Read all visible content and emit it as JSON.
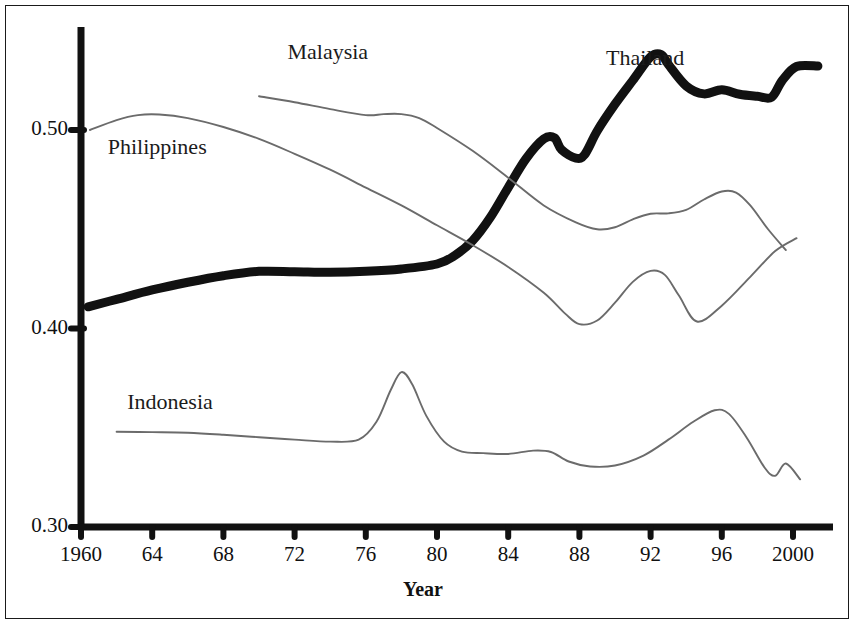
{
  "chart_data": {
    "type": "line",
    "title": "",
    "subtitle": "",
    "xlabel": "Year",
    "ylabel": "",
    "xlim": [
      1960,
      2002
    ],
    "ylim": [
      0.3,
      0.55
    ],
    "grid": false,
    "legend_position": "inline-labels",
    "x_tick_labels": [
      "1960",
      "64",
      "68",
      "72",
      "76",
      "80",
      "84",
      "88",
      "92",
      "96",
      "2000"
    ],
    "x_ticks": [
      1960,
      1964,
      1968,
      1972,
      1976,
      1980,
      1984,
      1988,
      1992,
      1996,
      2000
    ],
    "y_tick_labels": [
      "0.30",
      "0.40",
      "0.50"
    ],
    "y_ticks": [
      0.3,
      0.4,
      0.5
    ],
    "series": [
      {
        "name": "Thailand",
        "style": "thick-black",
        "color": "#111111",
        "label_x": 1989.5,
        "label_y": 0.5355,
        "x": [
          1960.4,
          1962,
          1964,
          1966,
          1968,
          1970,
          1972,
          1974,
          1976,
          1978,
          1980,
          1981,
          1982,
          1983,
          1984,
          1985,
          1986,
          1986.6,
          1987,
          1987.8,
          1988.3,
          1989,
          1990,
          1991,
          1992,
          1992.6,
          1993,
          1994,
          1995,
          1996,
          1997,
          1998,
          1998.8,
          1999.4,
          2000.2,
          2001.4
        ],
        "y": [
          0.4109,
          0.4147,
          0.4194,
          0.4233,
          0.4266,
          0.4288,
          0.4286,
          0.4283,
          0.4288,
          0.43,
          0.4325,
          0.4368,
          0.4442,
          0.456,
          0.471,
          0.4855,
          0.4955,
          0.496,
          0.49,
          0.4858,
          0.4877,
          0.4995,
          0.513,
          0.525,
          0.5368,
          0.538,
          0.533,
          0.5222,
          0.5182,
          0.5203,
          0.518,
          0.517,
          0.5165,
          0.525,
          0.532,
          0.5322
        ]
      },
      {
        "name": "Malaysia",
        "style": "thin-gray",
        "color": "#6b6b6b",
        "label_x": 1971.6,
        "label_y": 0.5385,
        "x": [
          1970,
          1972,
          1974,
          1976,
          1977,
          1978,
          1979,
          1980,
          1982,
          1984,
          1986,
          1987.8,
          1989,
          1990,
          1991,
          1992,
          1993,
          1994,
          1995,
          1996,
          1996.8,
          1997.6,
          1998.6,
          1999.6
        ],
        "y": [
          0.517,
          0.514,
          0.5105,
          0.5075,
          0.508,
          0.508,
          0.506,
          0.501,
          0.4895,
          0.476,
          0.462,
          0.4535,
          0.45,
          0.451,
          0.455,
          0.4578,
          0.458,
          0.4598,
          0.465,
          0.469,
          0.4685,
          0.462,
          0.45,
          0.4395
        ]
      },
      {
        "name": "Philippines",
        "style": "thin-gray",
        "color": "#6b6b6b",
        "label_x": 1961.5,
        "label_y": 0.4905,
        "x": [
          1960.5,
          1962,
          1963.2,
          1964.4,
          1966,
          1968,
          1970,
          1972,
          1974,
          1976,
          1978,
          1980,
          1982,
          1984,
          1986,
          1987.2,
          1988,
          1989,
          1990,
          1991,
          1992,
          1992.8,
          1993.6,
          1994.6,
          1996,
          1997.6,
          1999,
          2000.2
        ],
        "y": [
          0.5,
          0.505,
          0.5075,
          0.5078,
          0.506,
          0.5015,
          0.4955,
          0.488,
          0.48,
          0.471,
          0.462,
          0.452,
          0.442,
          0.431,
          0.418,
          0.4075,
          0.4022,
          0.404,
          0.413,
          0.4235,
          0.429,
          0.427,
          0.4165,
          0.4035,
          0.4115,
          0.426,
          0.439,
          0.4455
        ]
      },
      {
        "name": "Indonesia",
        "style": "thin-gray",
        "color": "#6b6b6b",
        "label_x": 1962.6,
        "label_y": 0.3618,
        "x": [
          1962,
          1964,
          1966,
          1968,
          1970,
          1972,
          1974,
          1975.6,
          1976.6,
          1977.4,
          1978,
          1978.6,
          1979.4,
          1980.4,
          1981.4,
          1982.6,
          1984,
          1985.4,
          1986.4,
          1987.4,
          1988.6,
          1990,
          1991.6,
          1993,
          1994.4,
          1995.6,
          1996.4,
          1997.4,
          1998.4,
          1999,
          1999.6,
          2000.4
        ],
        "y": [
          0.348,
          0.3478,
          0.3475,
          0.3465,
          0.3452,
          0.344,
          0.343,
          0.344,
          0.353,
          0.369,
          0.378,
          0.372,
          0.356,
          0.343,
          0.338,
          0.3372,
          0.3368,
          0.3385,
          0.3378,
          0.333,
          0.3305,
          0.331,
          0.336,
          0.344,
          0.353,
          0.3588,
          0.357,
          0.345,
          0.33,
          0.3258,
          0.332,
          0.324
        ]
      }
    ]
  },
  "axis": {
    "x_title": "Year"
  }
}
